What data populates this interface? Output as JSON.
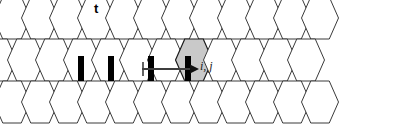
{
  "figure": {
    "title_label": "t",
    "cell_label": "i, j",
    "background_color": "#ffffff",
    "lattice": {
      "type": "honeycomb-hexagonal-grid",
      "orientation": "flat-top",
      "rows": 3,
      "columns_per_row": 11,
      "hex_width": 37,
      "hex_height": 42,
      "column_pitch": 28,
      "row_pitch": 21,
      "origin_x": -2,
      "origin_y": 18,
      "cell_fill": "#ffffff",
      "cell_stroke": "#3a3a3a",
      "cell_stroke_width": 1
    },
    "highlighted_cell": {
      "name": "i-j-cell",
      "row": 1,
      "col": 7,
      "fill": "#c9c9c9",
      "stroke": "#1a1a1a",
      "label": "i, j"
    },
    "thick_edges": {
      "color": "#000000",
      "width": 6,
      "description": "thick vertical bond segments on middle row",
      "positions": [
        {
          "x": 81,
          "y_top": 56,
          "y_bottom": 81
        },
        {
          "x": 111,
          "y_top": 56,
          "y_bottom": 81
        },
        {
          "x": 151,
          "y_top": 56,
          "y_bottom": 81
        },
        {
          "x": 188,
          "y_top": 56,
          "y_bottom": 81
        }
      ]
    },
    "arrow": {
      "name": "transport-arrow",
      "color": "#3d3d3d",
      "x_start": 142,
      "x_end": 199,
      "y": 69,
      "tick_x": 143,
      "tick_y_top": 62,
      "tick_y_bottom": 76,
      "head_width": 9,
      "head_height": 9
    }
  }
}
